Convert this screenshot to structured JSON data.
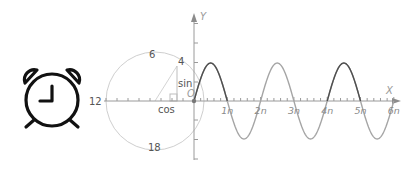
{
  "icon": {
    "name": "alarm-clock",
    "clock_time": "9:00",
    "stroke_color": "#111111"
  },
  "diagram": {
    "title": "",
    "unit_circle": {
      "labels": {
        "top": "6",
        "left": "12",
        "bottom": "18",
        "point": "4",
        "opposite": "sin",
        "adjacent": "cos",
        "origin": "O"
      },
      "circle_color": "#c8c8c8"
    },
    "axes": {
      "x_label": "X",
      "y_label": "Y",
      "x_ticks": [
        "1n",
        "2n",
        "3n",
        "4n",
        "5n",
        "6n"
      ],
      "axis_color": "#8c8c8c"
    },
    "wave": {
      "type": "sine",
      "amplitude_label": "4",
      "period_units": 2,
      "cycles_shown": 3,
      "dark_color": "#555555",
      "light_color": "#a0a0a0"
    }
  },
  "chart_data": {
    "type": "line",
    "title": "",
    "xlabel": "X",
    "ylabel": "Y",
    "x_tick_labels": [
      "1n",
      "2n",
      "3n",
      "4n",
      "5n",
      "6n"
    ],
    "xlim": [
      0,
      6
    ],
    "ylim": [
      -1,
      1
    ],
    "series": [
      {
        "name": "sine",
        "x": [
          0,
          0.5,
          1,
          1.5,
          2,
          2.5,
          3,
          3.5,
          4,
          4.5,
          5,
          5.5,
          6
        ],
        "values": [
          0,
          1,
          0,
          -1,
          0,
          1,
          0,
          -1,
          0,
          1,
          0,
          -1,
          0
        ]
      }
    ]
  }
}
